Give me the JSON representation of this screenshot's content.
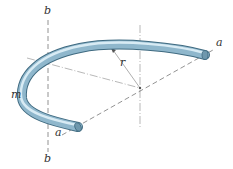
{
  "figure": {
    "labels": {
      "b_top": "b",
      "b_bottom": "b",
      "a_right": "a",
      "a_left": "a",
      "m": "m",
      "r": "r"
    },
    "colors": {
      "rod_light": "#c9e0ec",
      "rod_mid": "#8fb7cc",
      "rod_dark": "#4d7a91",
      "axis_line": "#666666"
    }
  }
}
